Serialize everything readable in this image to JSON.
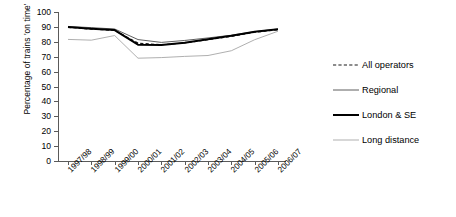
{
  "chart_data": {
    "type": "line",
    "title": "",
    "xlabel": "",
    "ylabel": "Percentage of trains 'on time'",
    "categories": [
      "1997/98",
      "1998/99",
      "1999/00",
      "2000/01",
      "2001/02",
      "2002/03",
      "2003/04",
      "2004/05",
      "2005/06",
      "2006/07"
    ],
    "ylim": [
      0,
      100
    ],
    "yticks": [
      0,
      10,
      20,
      30,
      40,
      50,
      60,
      70,
      80,
      90,
      100
    ],
    "grid": false,
    "legend_position": "right",
    "series": [
      {
        "name": "All operators",
        "style": "dashed",
        "color": "#1a1a1a",
        "values": [
          89.7,
          88.5,
          87.7,
          79.1,
          78.0,
          79.2,
          81.4,
          83.6,
          86.4,
          88.1
        ]
      },
      {
        "name": "Regional",
        "style": "thin",
        "color": "#4d4d4d",
        "values": [
          90.3,
          89.5,
          88.6,
          81.5,
          79.6,
          80.9,
          82.6,
          84.4,
          86.8,
          88.6
        ]
      },
      {
        "name": "London & SE",
        "style": "thick",
        "color": "#000000",
        "values": [
          90.0,
          88.8,
          87.9,
          78.1,
          77.8,
          79.3,
          81.7,
          84.0,
          86.7,
          88.4
        ]
      },
      {
        "name": "Long distance",
        "style": "light",
        "color": "#a6a6a6",
        "values": [
          81.6,
          81.1,
          84.2,
          69.0,
          69.4,
          70.2,
          70.8,
          74.0,
          81.4,
          87.1
        ]
      }
    ]
  },
  "legend": {
    "items": [
      {
        "label": "All operators"
      },
      {
        "label": "Regional"
      },
      {
        "label": "London & SE"
      },
      {
        "label": "Long distance"
      }
    ]
  }
}
